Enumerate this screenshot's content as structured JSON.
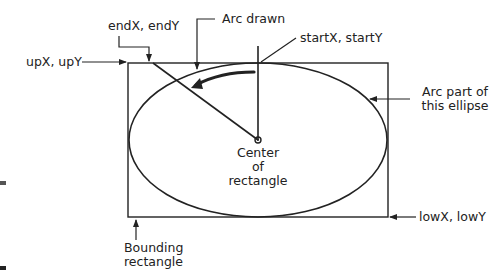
{
  "labels": {
    "end_point": "endX, endY",
    "arc_drawn": "Arc drawn",
    "start_point": "startX, startY",
    "upper_point": "upX, upY",
    "arc_ellipse_line1": "Arc part of",
    "arc_ellipse_line2": "this ellipse",
    "center_line1": "Center",
    "center_line2": "of",
    "center_line3": "rectangle",
    "lower_point": "lowX, lowY",
    "bounding_line1": "Bounding",
    "bounding_line2": "rectangle"
  },
  "colors": {
    "stroke": "#222222",
    "background": "#ffffff"
  }
}
